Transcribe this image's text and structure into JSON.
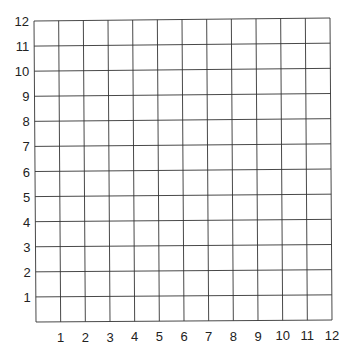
{
  "chart_data": {
    "type": "grid",
    "title": "",
    "xlabel": "",
    "ylabel": "",
    "x_ticks": [
      "1",
      "2",
      "3",
      "4",
      "5",
      "6",
      "7",
      "8",
      "9",
      "10",
      "11",
      "12"
    ],
    "y_ticks": [
      "1",
      "2",
      "3",
      "4",
      "5",
      "6",
      "7",
      "8",
      "9",
      "10",
      "11",
      "12"
    ],
    "xlim": [
      0,
      12
    ],
    "ylim": [
      0,
      12
    ],
    "grid": true,
    "series": []
  },
  "colors": {
    "grid_line": "#333333",
    "label": "#222222",
    "background": "#ffffff"
  }
}
